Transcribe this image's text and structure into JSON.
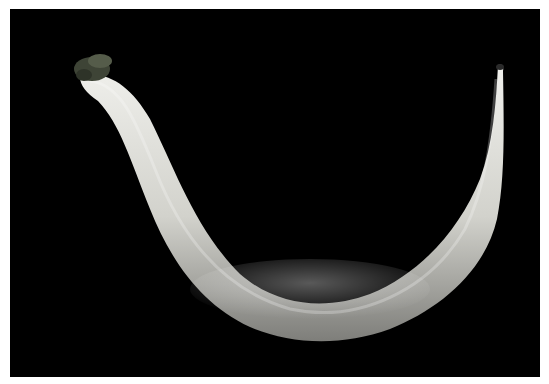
{
  "image": {
    "subject": "curved pale specimen on black background",
    "background_color": "#000000",
    "body_color": "#d8d8d2",
    "body_highlight_color": "#f2f2ee",
    "body_shadow_color": "#8a8a86",
    "tip_color": "#4a5040"
  }
}
